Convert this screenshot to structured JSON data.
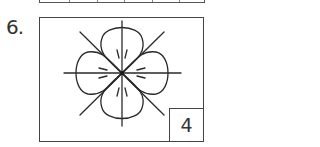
{
  "previous_table": {
    "divider_positions": [
      29,
      57,
      84,
      112,
      139
    ]
  },
  "problem": {
    "number_label": "6.",
    "answer_value": "4",
    "figure": {
      "description": "Four-lobed flower shape centered on crossed horizontal, vertical and diagonal lines with short tick marks near the center",
      "lobes": 4,
      "lines": 4,
      "stroke_color": "#2a2a2a"
    }
  }
}
